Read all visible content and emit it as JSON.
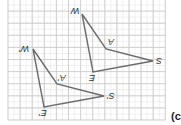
{
  "figure": {
    "caption": "(c",
    "grid": {
      "x0": 8,
      "y0": 0,
      "x1": 165,
      "y1": 120,
      "major_step": 12.1,
      "minor_step": 6.05,
      "major_color": "#c8c8c8",
      "minor_color": "#e6e6e6"
    },
    "line_color": "#6b6b6b",
    "triangles": [
      {
        "name": "original",
        "vertices": [
          {
            "label": "W",
            "x": 82,
            "y": 14
          },
          {
            "label": "A",
            "x": 106,
            "y": 49
          },
          {
            "label": "S",
            "x": 153,
            "y": 61
          },
          {
            "label": "E",
            "x": 93,
            "y": 72
          }
        ]
      },
      {
        "name": "image",
        "vertices": [
          {
            "label": "W'",
            "x": 33,
            "y": 49
          },
          {
            "label": "A'",
            "x": 57,
            "y": 84
          },
          {
            "label": "S'",
            "x": 104,
            "y": 96
          },
          {
            "label": "E'",
            "x": 44,
            "y": 107
          }
        ]
      }
    ]
  },
  "labels": {
    "W": "W",
    "A": "A",
    "S": "S",
    "E": "E",
    "W_prime": "W'",
    "A_prime": "A'",
    "S_prime": "S'",
    "E_prime": "E'"
  }
}
